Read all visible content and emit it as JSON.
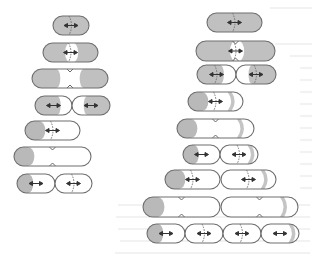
{
  "figure": {
    "colors": {
      "old_pole": "#b9b9b9",
      "crescent": "#c4c4c4",
      "outline": "#6e6e6e",
      "background": "#ffffff"
    },
    "columns": [
      {
        "name": "left-series",
        "stages": [
          {
            "stage": 1,
            "cells": [
              {
                "body": "grey",
                "septum": true,
                "arrows": true
              }
            ]
          },
          {
            "stage": 2,
            "cells": [
              {
                "body": "grey",
                "new_pole_white": true,
                "septum": true,
                "arrows": true
              }
            ]
          },
          {
            "stage": 3,
            "cells": [
              {
                "body": "grey-ends",
                "constriction": true,
                "white_middle": true
              }
            ]
          },
          {
            "stage": 4,
            "cells": [
              {
                "body": "grey-left",
                "arrows": true
              },
              {
                "body": "grey-right",
                "arrows": true
              }
            ]
          },
          {
            "stage": 5,
            "cells": [
              {
                "old_pole": "left",
                "septum": true,
                "arrows": true
              }
            ]
          },
          {
            "stage": 6,
            "cells": [
              {
                "old_pole": "left",
                "constriction": true
              }
            ]
          },
          {
            "stage": 7,
            "cells": [
              {
                "old_pole": "left",
                "arrows": true
              },
              {
                "septum": true,
                "arrows": true
              }
            ]
          }
        ]
      },
      {
        "name": "right-series",
        "stages": [
          {
            "stage": 1,
            "cells": [
              {
                "body": "grey",
                "septum": true,
                "arrows": true
              }
            ]
          },
          {
            "stage": 2,
            "cells": [
              {
                "body": "grey",
                "white_middle": true,
                "septum": true,
                "constriction": true,
                "arrows": true
              }
            ]
          },
          {
            "stage": 3,
            "cells": [
              {
                "body": "grey-left",
                "septum": true,
                "arrows": true
              },
              {
                "body": "grey-right",
                "septum": true,
                "arrows": true
              }
            ]
          },
          {
            "stage": 4,
            "cells": [
              {
                "old_pole": "left",
                "crescent": "right",
                "septum": true,
                "arrows": true
              }
            ]
          },
          {
            "stage": 5,
            "cells": [
              {
                "old_pole": "left",
                "crescent": "right",
                "constriction": true
              }
            ]
          },
          {
            "stage": 6,
            "cells": [
              {
                "old_pole": "left",
                "arrows": true
              },
              {
                "crescent": "right",
                "septum": true,
                "arrows": true
              }
            ]
          },
          {
            "stage": 7,
            "cells": [
              {
                "old_pole": "left",
                "septum": true,
                "arrows": true
              },
              {
                "crescent": "right",
                "septum": true,
                "arrows": true
              }
            ]
          },
          {
            "stage": 8,
            "cells": [
              {
                "old_pole": "left",
                "constriction": true
              },
              {
                "crescent": "right",
                "constriction": true
              }
            ]
          },
          {
            "stage": 9,
            "cells": [
              {
                "old_pole": "left",
                "arrows": true
              },
              {
                "septum": true,
                "arrows": true
              },
              {
                "septum": true,
                "arrows": true
              },
              {
                "crescent": "right",
                "arrows": true
              }
            ]
          }
        ]
      }
    ]
  }
}
